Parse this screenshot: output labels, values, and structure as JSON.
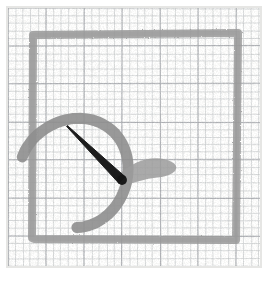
{
  "image": {
    "title": "Hand-drawn pencil sketch on graph paper",
    "subject": "stylized-hand-with-pointer",
    "width": 274,
    "height": 281,
    "background_color": "#ffffff",
    "medium": "graphite pencil"
  },
  "paper": {
    "name": "graph-paper",
    "sheet_color": "#fbfbfa",
    "sheet_rect": {
      "x": 8,
      "y": 8,
      "width": 252,
      "height": 258
    },
    "minor_grid": {
      "spacing": 7.6,
      "color": "#c9cbcd",
      "line_width": 0.7,
      "visible": true
    },
    "major_grid": {
      "spacing": 38,
      "color": "#a9acb0",
      "line_width": 0.9,
      "visible": true
    },
    "edge_shadow_color": "#e6e6e4",
    "texture_opacity": 0.06
  },
  "palette": {
    "frame_gray": "#9a9a9a",
    "frame_gray_light": "#a8a8a8",
    "arc_gray": "#8e8e8e",
    "finger_gray": "#8a8a8a",
    "finger_dark": "#6f6f6f",
    "hook_gray": "#9c9c9c",
    "needle_black": "#161616",
    "needle_tip": "#2a2a2a"
  },
  "strokes": [
    {
      "name": "frame-rectangle",
      "role": "outer border rectangle drawn in gray pencil",
      "type": "rect-open-left",
      "x": 32,
      "y": 33,
      "width": 206,
      "height": 207,
      "stroke_color": "#9a9a9a",
      "stroke_width": 8,
      "opacity": 0.85
    },
    {
      "name": "palm-arc",
      "role": "large C shaped arc forming palm outline",
      "type": "arc",
      "center_x": 75,
      "center_y": 172,
      "radius": 54,
      "start_angle_deg": 196,
      "end_angle_deg": 88,
      "stroke_color": "#8e8e8e",
      "stroke_width": 11,
      "opacity": 0.9
    },
    {
      "name": "finger-bar-1",
      "role": "topmost horizontal finger stroke",
      "type": "capsule",
      "x1": 36,
      "y1": 142,
      "x2": 84,
      "y2": 142,
      "stroke_color": "#8a8a8a",
      "stroke_width": 11,
      "opacity": 0.88
    },
    {
      "name": "finger-bar-2",
      "role": "second horizontal finger stroke",
      "type": "capsule",
      "x1": 34,
      "y1": 160,
      "x2": 86,
      "y2": 160,
      "stroke_color": "#8a8a8a",
      "stroke_width": 11,
      "opacity": 0.88
    },
    {
      "name": "finger-bar-3",
      "role": "third horizontal finger stroke",
      "type": "capsule",
      "x1": 34,
      "y1": 178,
      "x2": 86,
      "y2": 178,
      "stroke_color": "#8a8a8a",
      "stroke_width": 11,
      "opacity": 0.88
    },
    {
      "name": "finger-bar-4",
      "role": "bottom darker horizontal stroke overlapping frame base",
      "type": "capsule",
      "x1": 34,
      "y1": 240,
      "x2": 84,
      "y2": 240,
      "stroke_color": "#6f6f6f",
      "stroke_width": 12,
      "opacity": 0.92
    },
    {
      "name": "thumb-hook",
      "role": "gray hook blob extending right from needle base",
      "type": "tapered-curve",
      "stroke_color": "#9c9c9c",
      "opacity": 0.85,
      "points": [
        [
          118,
          178
        ],
        [
          133,
          166
        ],
        [
          152,
          160
        ],
        [
          168,
          162
        ],
        [
          176,
          168
        ],
        [
          166,
          174
        ],
        [
          148,
          176
        ],
        [
          130,
          181
        ]
      ]
    },
    {
      "name": "needle-pointer",
      "role": "dark tapered needle pointing up and to the left",
      "type": "tapered-line",
      "tip_x": 67,
      "tip_y": 126,
      "base_x": 122,
      "base_y": 180,
      "base_width": 9,
      "tip_width": 1,
      "stroke_color": "#161616",
      "opacity": 0.97
    }
  ],
  "accessibility": {
    "alt_text": "A pencil sketch on graph paper showing a gray square frame, a C-shaped arc with four horizontal finger-like bars on the left, a dark tapered needle pointing up-left, and a gray hook shape to the right."
  }
}
